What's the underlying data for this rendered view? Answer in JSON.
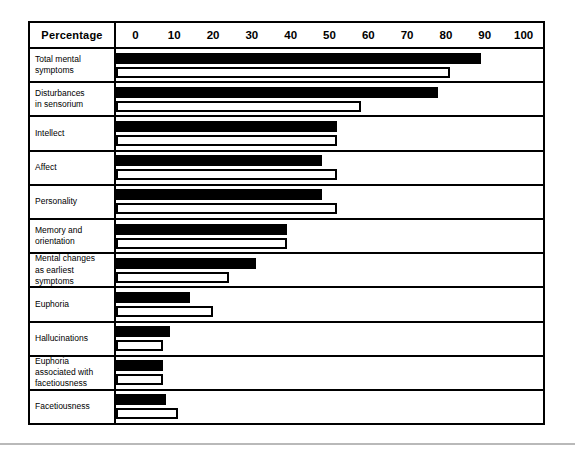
{
  "chart_data": {
    "type": "bar",
    "orientation": "horizontal",
    "title": "",
    "xlabel": "Percentage",
    "ylabel": "",
    "xlim": [
      0,
      100
    ],
    "grid": false,
    "legend": null,
    "header_label": "Percentage",
    "tick_labels": [
      "0",
      "10",
      "20",
      "30",
      "40",
      "50",
      "60",
      "70",
      "80",
      "90",
      "100"
    ],
    "ticks": [
      0,
      10,
      20,
      30,
      40,
      50,
      60,
      70,
      80,
      90,
      100
    ],
    "categories": [
      "Total mental symptoms",
      "Disturbances in sensorium",
      "Intellect",
      "Affect",
      "Personality",
      "Memory and orientation",
      "Mental changes as earliest symptoms",
      "Euphoria",
      "Hallucinations",
      "Euphoria associated with facetiousness",
      "Facetiousness"
    ],
    "series": [
      {
        "name": "solid",
        "style": "filled-black",
        "values": [
          89,
          78,
          52,
          48,
          48,
          39,
          31,
          14,
          9,
          7,
          8
        ]
      },
      {
        "name": "hollow",
        "style": "outlined-white",
        "values": [
          81,
          58,
          52,
          52,
          52,
          39,
          24,
          20,
          7,
          7,
          11
        ]
      }
    ]
  },
  "rows": [
    {
      "label": "Total mental\nsymptoms"
    },
    {
      "label": "Disturbances\nin sensorium"
    },
    {
      "label": "Intellect"
    },
    {
      "label": "Affect"
    },
    {
      "label": "Personality"
    },
    {
      "label": "Memory and\norientation"
    },
    {
      "label": "Mental changes\nas earliest\nsymptoms"
    },
    {
      "label": "Euphoria"
    },
    {
      "label": "Hallucinations"
    },
    {
      "label": "Euphoria\nassociated with\nfacetiousness"
    },
    {
      "label": "Facetiousness"
    }
  ],
  "colors": {
    "bar_solid": "#000000",
    "bar_hollow_fill": "#ffffff",
    "bar_outline": "#000000",
    "frame": "#000000",
    "background": "#ffffff",
    "rule": "#b9b9b9"
  }
}
